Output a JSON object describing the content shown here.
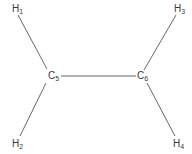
{
  "diagram": {
    "type": "molecular-structure",
    "line_color": "#555555",
    "atoms": [
      {
        "id": "H1",
        "element": "H",
        "subscript": "1",
        "x": 12,
        "y": 4
      },
      {
        "id": "H2",
        "element": "H",
        "subscript": "2",
        "x": 12,
        "y": 139
      },
      {
        "id": "H3",
        "element": "H",
        "subscript": "3",
        "x": 174,
        "y": 4
      },
      {
        "id": "H4",
        "element": "H",
        "subscript": "4",
        "x": 173,
        "y": 139
      },
      {
        "id": "C5",
        "element": "C",
        "subscript": "5",
        "x": 48,
        "y": 71
      },
      {
        "id": "C6",
        "element": "C",
        "subscript": "6",
        "x": 137,
        "y": 71
      }
    ],
    "bonds": [
      {
        "from": "H1",
        "to": "C5"
      },
      {
        "from": "H2",
        "to": "C5"
      },
      {
        "from": "C5",
        "to": "C6"
      },
      {
        "from": "C6",
        "to": "H3"
      },
      {
        "from": "C6",
        "to": "H4"
      }
    ]
  }
}
